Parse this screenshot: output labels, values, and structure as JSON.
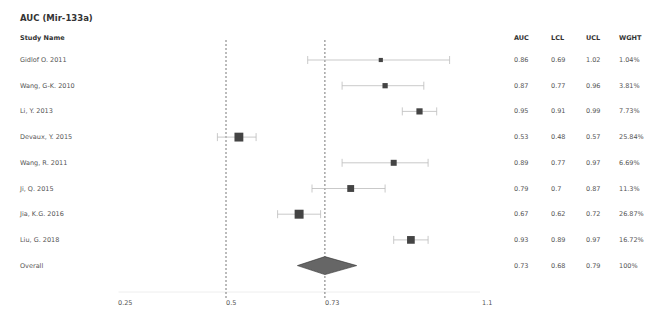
{
  "title": "AUC (Mir-133a)",
  "headers": {
    "study": "Study Name",
    "auc": "AUC",
    "lcl": "LCL",
    "ucl": "UCL",
    "wght": "WGHT"
  },
  "rows": [
    {
      "study": "Gidlof O. 2011",
      "auc": "0.86",
      "lcl": "0.69",
      "ucl": "1.02",
      "wght": "1.04%"
    },
    {
      "study": "Wang, G-K. 2010",
      "auc": "0.87",
      "lcl": "0.77",
      "ucl": "0.96",
      "wght": "3.81%"
    },
    {
      "study": "Li, Y. 2013",
      "auc": "0.95",
      "lcl": "0.91",
      "ucl": "0.99",
      "wght": "7.73%"
    },
    {
      "study": "Devaux, Y. 2015",
      "auc": "0.53",
      "lcl": "0.48",
      "ucl": "0.57",
      "wght": "25.84%"
    },
    {
      "study": "Wang, R. 2011",
      "auc": "0.89",
      "lcl": "0.77",
      "ucl": "0.97",
      "wght": "6.69%"
    },
    {
      "study": "Ji, Q. 2015",
      "auc": "0.79",
      "lcl": "0.7",
      "ucl": "0.87",
      "wght": "11.3%"
    },
    {
      "study": "Jia, K.G. 2016",
      "auc": "0.67",
      "lcl": "0.62",
      "ucl": "0.72",
      "wght": "26.87%"
    },
    {
      "study": "Liu, G. 2018",
      "auc": "0.93",
      "lcl": "0.89",
      "ucl": "0.97",
      "wght": "16.72%"
    },
    {
      "study": "Overall",
      "auc": "0.73",
      "lcl": "0.68",
      "ucl": "0.79",
      "wght": "100%"
    }
  ],
  "axis": {
    "ticks": [
      "0.25",
      "0.5",
      "0.73",
      "1.1"
    ]
  },
  "colors": {
    "marker": "#444444",
    "diamond": "#666666",
    "ci_line": "#bbbbbb",
    "ref_line": "#555555"
  },
  "chart_data": {
    "type": "forest",
    "title": "AUC (Mir-133a)",
    "xlabel": "",
    "ylabel": "",
    "xlim": [
      0.25,
      1.1
    ],
    "xticks": [
      0.25,
      0.5,
      0.73,
      1.1
    ],
    "reference_lines": [
      0.5,
      0.73
    ],
    "categories": [
      "Gidlof O. 2011",
      "Wang, G-K. 2010",
      "Li, Y. 2013",
      "Devaux, Y. 2015",
      "Wang, R. 2011",
      "Ji, Q. 2015",
      "Jia, K.G. 2016",
      "Liu, G. 2018",
      "Overall"
    ],
    "series": [
      {
        "name": "AUC",
        "values": [
          0.86,
          0.87,
          0.95,
          0.53,
          0.89,
          0.79,
          0.67,
          0.93,
          0.73
        ]
      },
      {
        "name": "LCL",
        "values": [
          0.69,
          0.77,
          0.91,
          0.48,
          0.77,
          0.7,
          0.62,
          0.89,
          0.68
        ]
      },
      {
        "name": "UCL",
        "values": [
          1.02,
          0.96,
          0.99,
          0.57,
          0.97,
          0.87,
          0.72,
          0.97,
          0.79
        ]
      },
      {
        "name": "WGHT (%)",
        "values": [
          1.04,
          3.81,
          7.73,
          25.84,
          6.69,
          11.3,
          26.87,
          16.72,
          100
        ]
      }
    ],
    "grid": false,
    "legend": null
  }
}
